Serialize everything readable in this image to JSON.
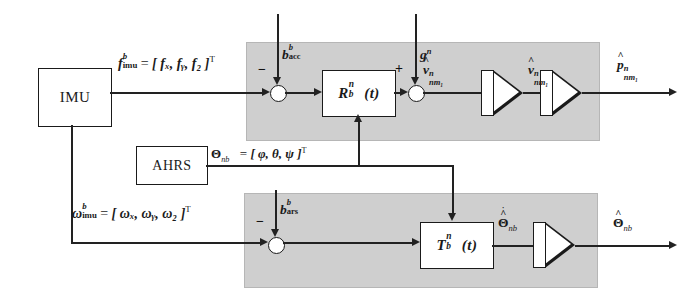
{
  "diagram": {
    "panel_color": "#cfcfcf",
    "line_color": "#222222"
  },
  "blocks": {
    "imu": "IMU",
    "ahrs": "AHRS",
    "rotation": {
      "base": "R",
      "sup": "n",
      "sub": "b",
      "arg": "(t)"
    },
    "transform": {
      "base": "T",
      "sup": "n",
      "sub": "b",
      "arg": "(t)"
    },
    "integrator_velocity": "integrator",
    "integrator_position": "integrator",
    "integrator_attitude": "integrator"
  },
  "signals": {
    "specific_force": {
      "base": "f",
      "sup": "b",
      "sub": "imu",
      "equals": "=",
      "vector": "[ fₓ, fᵧ, f₂ ]",
      "transpose": "T"
    },
    "angular_rate": {
      "base": "ω",
      "sup": "b",
      "sub": "imu",
      "equals": "=",
      "vector": "[ ωₓ, ωᵧ, ω₂ ]",
      "transpose": "T"
    },
    "euler_angles": {
      "base": "Θ",
      "sub": "nb",
      "equals": "=",
      "vector": "[ φ, θ, ψ ]",
      "transpose": "T"
    },
    "acc_bias": {
      "base": "b",
      "sup": "b",
      "sub": "acc"
    },
    "ars_bias": {
      "base": "b",
      "sup": "b",
      "sub": "ars"
    },
    "gravity": {
      "base": "g",
      "sup": "n"
    },
    "velocity_rate": {
      "base": "v",
      "sup": "n",
      "sub": "nm₁",
      "accent": "dot-hat"
    },
    "velocity_est": {
      "base": "v",
      "sup": "n",
      "sub": "nm₁",
      "accent": "hat"
    },
    "position_est": {
      "base": "p",
      "sup": "n",
      "sub": "nm₁",
      "accent": "hat"
    },
    "euler_rate_est": {
      "base": "Θ",
      "sub": "nb",
      "accent": "dot-hat"
    },
    "euler_est": {
      "base": "Θ",
      "sub": "nb",
      "accent": "hat"
    }
  },
  "junctions": {
    "acc_sign": "−",
    "gravity_sign": "+",
    "ars_sign": "−"
  }
}
